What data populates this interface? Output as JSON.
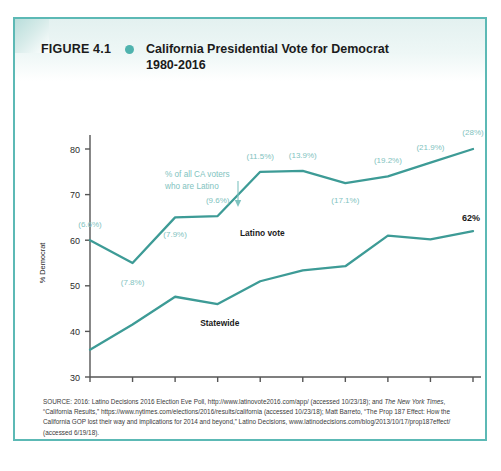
{
  "figure": {
    "number": "FIGURE 4.1",
    "bullet_icon": "bullet-dot-icon",
    "title_line1": "California Presidential Vote for Democrat",
    "title_line2": "1980-2016",
    "frame_color": "#5cb9b5",
    "accent_color": "#4fb3ae"
  },
  "source": {
    "label": "SOURCE:",
    "text_1": " 2016: Latino Decisions 2016 Election Eve Poll,  http://www.latinovote2016.com/app/ (accessed 10/23/18); and ",
    "italic_1": "The New York Times",
    "text_2": ", “California Results,” https://www.nytimes.com/elections/2016/results/california (accessed 10/23/18); Matt Barreto, “The Prop 187 Effect: How the California GOP lost their way and implications for 2014 and beyond,” Latino Decisions, www.latinodecisions.com/blog/2013/10/17/prop187effect/ (accessed 6/19/18)."
  },
  "chart_data": {
    "type": "line",
    "title": "California Presidential Vote for Democrat 1980-2016",
    "xlabel": "",
    "ylabel": "% Democrat",
    "x": [
      "1980",
      "1984",
      "1988",
      "1992",
      "1996",
      "2000",
      "2004",
      "2008",
      "2012",
      "2016"
    ],
    "ylim": [
      30,
      80
    ],
    "yticks": [
      30,
      40,
      50,
      60,
      70,
      80
    ],
    "grid": false,
    "legend": "inline-labels",
    "line_color": "#3d9b96",
    "annotation_color": "#7fc3c0",
    "series": [
      {
        "name": "Latino vote",
        "label": "Latino vote",
        "values": [
          60.0,
          55.0,
          65.0,
          65.3,
          75.0,
          75.2,
          72.5,
          74.0,
          77.0,
          80.0
        ],
        "point_annotations": [
          "(6.6%)",
          "(7.8%)",
          "(7.9%)",
          "(9.6%)",
          "(11.5%)",
          "(13.9%)",
          "(17.1%)",
          "(19.2%)",
          "(21.9%)",
          "(28%)"
        ]
      },
      {
        "name": "Statewide",
        "label": "Statewide",
        "values": [
          36.0,
          41.5,
          47.6,
          46.0,
          51.0,
          53.4,
          54.3,
          61.0,
          60.2,
          62.0
        ],
        "end_label": "62%"
      }
    ],
    "callout": {
      "line1": "% of all CA voters",
      "line2": "who are Latino",
      "arrow": "down-arrow-icon"
    }
  }
}
